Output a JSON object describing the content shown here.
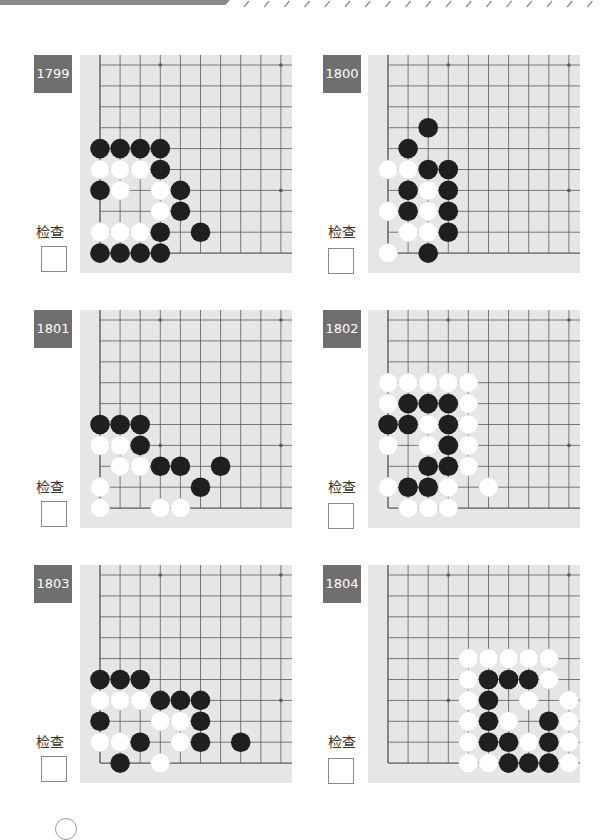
{
  "header": {
    "bar_color": "#8a8a8a",
    "pattern": "diagonal-slashes"
  },
  "board_style": {
    "background": "#e6e6e6",
    "line_color": "#5a5a5a",
    "black_stone": "#1f1f1f",
    "white_stone": "#ffffff",
    "badge_color": "#6f6f6f"
  },
  "check_label": "检查",
  "problems": [
    {
      "number": "1799",
      "stars": [
        [
          3,
          0
        ],
        [
          9,
          0
        ],
        [
          9,
          6
        ]
      ],
      "black": [
        [
          0,
          4
        ],
        [
          1,
          4
        ],
        [
          2,
          4
        ],
        [
          3,
          4
        ],
        [
          3,
          5
        ],
        [
          0,
          6
        ],
        [
          4,
          6
        ],
        [
          4,
          7
        ],
        [
          3,
          8
        ],
        [
          5,
          8
        ],
        [
          0,
          9
        ],
        [
          1,
          9
        ],
        [
          2,
          9
        ],
        [
          3,
          9
        ]
      ],
      "white": [
        [
          0,
          5
        ],
        [
          1,
          5
        ],
        [
          2,
          5
        ],
        [
          1,
          6
        ],
        [
          3,
          6
        ],
        [
          3,
          7
        ],
        [
          0,
          8
        ],
        [
          1,
          8
        ],
        [
          2,
          8
        ]
      ]
    },
    {
      "number": "1800",
      "stars": [
        [
          3,
          0
        ],
        [
          9,
          0
        ],
        [
          9,
          6
        ]
      ],
      "black": [
        [
          2,
          3
        ],
        [
          1,
          4
        ],
        [
          2,
          5
        ],
        [
          3,
          5
        ],
        [
          1,
          6
        ],
        [
          3,
          6
        ],
        [
          1,
          7
        ],
        [
          3,
          7
        ],
        [
          3,
          8
        ],
        [
          2,
          9
        ]
      ],
      "white": [
        [
          0,
          5
        ],
        [
          1,
          5
        ],
        [
          2,
          6
        ],
        [
          0,
          7
        ],
        [
          2,
          7
        ],
        [
          1,
          8
        ],
        [
          2,
          8
        ],
        [
          0,
          9
        ]
      ]
    },
    {
      "number": "1801",
      "stars": [
        [
          3,
          0
        ],
        [
          9,
          0
        ],
        [
          3,
          6
        ],
        [
          9,
          6
        ]
      ],
      "black": [
        [
          0,
          5
        ],
        [
          1,
          5
        ],
        [
          2,
          5
        ],
        [
          2,
          6
        ],
        [
          3,
          7
        ],
        [
          4,
          7
        ],
        [
          6,
          7
        ],
        [
          5,
          8
        ]
      ],
      "white": [
        [
          0,
          6
        ],
        [
          1,
          6
        ],
        [
          1,
          7
        ],
        [
          2,
          7
        ],
        [
          0,
          8
        ],
        [
          0,
          9
        ],
        [
          3,
          9
        ],
        [
          4,
          9
        ]
      ]
    },
    {
      "number": "1802",
      "stars": [
        [
          3,
          0
        ],
        [
          9,
          0
        ],
        [
          9,
          6
        ]
      ],
      "black": [
        [
          1,
          4
        ],
        [
          2,
          4
        ],
        [
          3,
          4
        ],
        [
          0,
          5
        ],
        [
          1,
          5
        ],
        [
          3,
          5
        ],
        [
          3,
          6
        ],
        [
          2,
          7
        ],
        [
          3,
          7
        ],
        [
          1,
          8
        ],
        [
          2,
          8
        ]
      ],
      "white": [
        [
          0,
          3
        ],
        [
          1,
          3
        ],
        [
          2,
          3
        ],
        [
          3,
          3
        ],
        [
          4,
          3
        ],
        [
          0,
          4
        ],
        [
          4,
          4
        ],
        [
          2,
          5
        ],
        [
          4,
          5
        ],
        [
          0,
          6
        ],
        [
          2,
          6
        ],
        [
          4,
          6
        ],
        [
          4,
          7
        ],
        [
          0,
          8
        ],
        [
          3,
          8
        ],
        [
          5,
          8
        ],
        [
          1,
          9
        ],
        [
          2,
          9
        ],
        [
          3,
          9
        ]
      ]
    },
    {
      "number": "1803",
      "stars": [
        [
          3,
          0
        ],
        [
          9,
          0
        ],
        [
          9,
          6
        ]
      ],
      "black": [
        [
          0,
          5
        ],
        [
          1,
          5
        ],
        [
          2,
          5
        ],
        [
          3,
          6
        ],
        [
          4,
          6
        ],
        [
          5,
          6
        ],
        [
          0,
          7
        ],
        [
          5,
          7
        ],
        [
          2,
          8
        ],
        [
          5,
          8
        ],
        [
          7,
          8
        ],
        [
          1,
          9
        ]
      ],
      "white": [
        [
          0,
          6
        ],
        [
          1,
          6
        ],
        [
          2,
          6
        ],
        [
          3,
          7
        ],
        [
          4,
          7
        ],
        [
          0,
          8
        ],
        [
          1,
          8
        ],
        [
          4,
          8
        ],
        [
          3,
          9
        ]
      ]
    },
    {
      "number": "1804",
      "stars": [
        [
          3,
          0
        ],
        [
          9,
          0
        ],
        [
          3,
          6
        ]
      ],
      "black": [
        [
          5,
          5
        ],
        [
          6,
          5
        ],
        [
          7,
          5
        ],
        [
          5,
          6
        ],
        [
          5,
          7
        ],
        [
          8,
          7
        ],
        [
          5,
          8
        ],
        [
          6,
          8
        ],
        [
          8,
          8
        ],
        [
          6,
          9
        ],
        [
          7,
          9
        ],
        [
          8,
          9
        ]
      ],
      "white": [
        [
          4,
          4
        ],
        [
          5,
          4
        ],
        [
          6,
          4
        ],
        [
          7,
          4
        ],
        [
          8,
          4
        ],
        [
          4,
          5
        ],
        [
          8,
          5
        ],
        [
          4,
          6
        ],
        [
          7,
          6
        ],
        [
          9,
          6
        ],
        [
          4,
          7
        ],
        [
          6,
          7
        ],
        [
          9,
          7
        ],
        [
          4,
          8
        ],
        [
          7,
          8
        ],
        [
          9,
          8
        ],
        [
          4,
          9
        ],
        [
          5,
          9
        ],
        [
          9,
          9
        ]
      ]
    }
  ]
}
